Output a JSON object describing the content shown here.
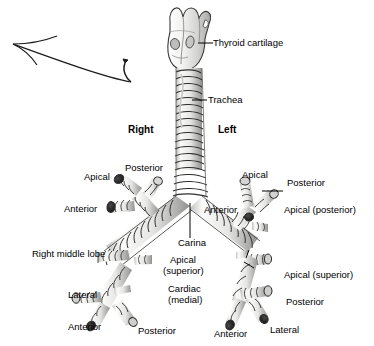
{
  "figure": {
    "background_color": "#ffffff",
    "ink_color": "#000000",
    "cartilage_fill": "#e8e8e6",
    "cartilage_shade": "#9a9a98",
    "lumen_color": "#1a1a1a"
  },
  "side_labels": {
    "right": "Right",
    "left": "Left"
  },
  "structures": {
    "thyroid_cartilage": "Thyroid cartilage",
    "trachea": "Trachea",
    "carina": "Carina",
    "right_middle_lobe": "Right middle lobe"
  },
  "right_lung": {
    "upper": {
      "apical": "Apical",
      "posterior": "Posterior",
      "anterior": "Anterior"
    },
    "middle": {
      "lateral": "Lateral",
      "medial_note": "Right middle lobe"
    },
    "lower": {
      "apical_superior": "Apical",
      "apical_superior_2": "(superior)",
      "cardiac_medial": "Cardiac",
      "cardiac_medial_2": "(medial)",
      "lateral": "Lateral",
      "anterior": "Anterior",
      "posterior": "Posterior"
    }
  },
  "left_lung": {
    "upper": {
      "apical": "Apical",
      "posterior": "Posterior",
      "anterior": "Anterior",
      "apical_posterior": "Apical (posterior)"
    },
    "lower": {
      "apical_superior": "Apical (superior)",
      "posterior": "Posterior",
      "lateral": "Lateral",
      "anterior": "Anterior"
    }
  },
  "annotations": {
    "arrow_1_name": "hand-drawn-arrow-pointing-upper-left"
  }
}
